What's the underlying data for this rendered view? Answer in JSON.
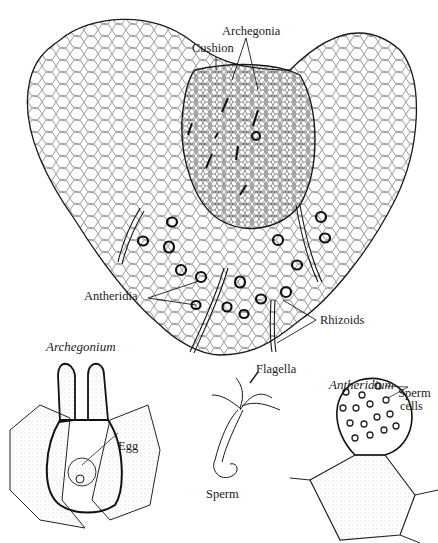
{
  "figure": {
    "ink_color": "#1a1a1a",
    "background": "#ffffff"
  },
  "labels": {
    "archegonia": "Archegonia",
    "cushion": "Cushion",
    "antheridia": "Antheridia",
    "rhizoids": "Rhizoids",
    "archegonium_title": "Archegonium",
    "egg": "Egg",
    "flagella": "Flagella",
    "sperm": "Sperm",
    "antheridium_title": "Antheridium",
    "sperm_cells_line1": "Sperm",
    "sperm_cells_line2": "cells"
  },
  "panels": [
    {
      "name": "prothallus",
      "labels": [
        "Archegonia",
        "Cushion",
        "Antheridia",
        "Rhizoids"
      ]
    },
    {
      "name": "archegonium",
      "title": "Archegonium",
      "labels": [
        "Egg"
      ]
    },
    {
      "name": "sperm",
      "labels": [
        "Flagella",
        "Sperm"
      ]
    },
    {
      "name": "antheridium",
      "title": "Antheridium",
      "labels": [
        "Sperm cells"
      ]
    }
  ]
}
